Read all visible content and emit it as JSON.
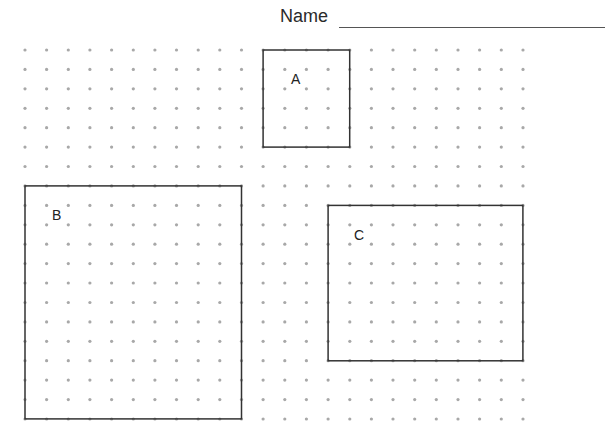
{
  "header": {
    "name_label": "Name",
    "name_field_value": ""
  },
  "grid": {
    "columns": 24,
    "rows": 20,
    "origin_x": 25,
    "origin_y": 50,
    "spacing_x": 21.65,
    "spacing_y": 19.42,
    "dot_color": "#a8a8a8",
    "line_color": "#333333"
  },
  "rectangles": [
    {
      "label": "A",
      "col": 11,
      "row": 0,
      "width_units": 4,
      "height_units": 5,
      "label_x": 291,
      "label_y": 72
    },
    {
      "label": "B",
      "col": 0,
      "row": 7,
      "width_units": 10,
      "height_units": 12,
      "label_x": 52,
      "label_y": 208
    },
    {
      "label": "C",
      "col": 14,
      "row": 8,
      "width_units": 9,
      "height_units": 8,
      "label_x": 354,
      "label_y": 228
    }
  ]
}
